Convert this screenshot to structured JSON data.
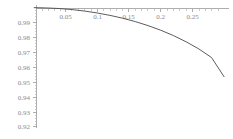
{
  "chart_data": {
    "type": "line",
    "title": "",
    "subtitle": "",
    "xlabel": "",
    "ylabel": "",
    "xlim": [
      0,
      0.3
    ],
    "ylim": [
      0.92,
      1.0
    ],
    "grid": false,
    "legend": null,
    "annotations": [],
    "x_ticks": [
      0.05,
      0.1,
      0.15,
      0.2,
      0.25
    ],
    "x_tick_labels": [
      "0.05",
      "0.1",
      "0.15",
      "0.2",
      "0.25"
    ],
    "x_minor_tick_count_between": 4,
    "y_ticks": [
      0.99,
      0.98,
      0.97,
      0.96,
      0.95,
      0.94,
      0.93,
      0.92
    ],
    "y_tick_labels": [
      "0.99",
      "0.98",
      "0.97",
      "0.96",
      "0.95",
      "0.94",
      "0.93",
      "0.92"
    ],
    "y_minor_tick_count_between": 4,
    "series": [
      {
        "name": "curve",
        "color": "#4a4a4a",
        "x": [
          0.0,
          0.02,
          0.04,
          0.06,
          0.08,
          0.1,
          0.12,
          0.14,
          0.16,
          0.18,
          0.2,
          0.22,
          0.24,
          0.26,
          0.28,
          0.3
        ],
        "y": [
          1.0,
          0.9998,
          0.9994,
          0.9987,
          0.9977,
          0.9964,
          0.9948,
          0.9929,
          0.9906,
          0.9879,
          0.9848,
          0.9812,
          0.977,
          0.9722,
          0.9664,
          0.9533
        ]
      }
    ]
  },
  "axes": {
    "x_axis_name": "horizontal-axis",
    "y_axis_name": "vertical-axis"
  }
}
